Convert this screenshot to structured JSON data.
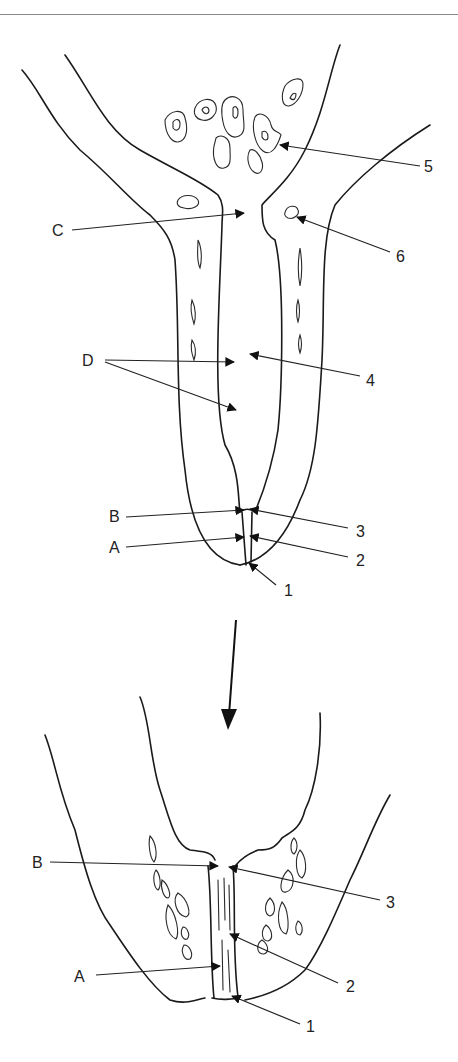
{
  "figure": {
    "type": "anatomical line diagram",
    "panels": [
      {
        "id": "upper",
        "labels_left": [
          "C",
          "D",
          "B",
          "A"
        ],
        "labels_right": [
          "5",
          "6",
          "4",
          "3",
          "2",
          "1"
        ]
      },
      {
        "id": "lower",
        "labels_left": [
          "B",
          "A"
        ],
        "labels_right": [
          "3",
          "2",
          "1"
        ]
      }
    ],
    "transition_arrow": "down-arrow"
  },
  "labels": {
    "upper": {
      "C": "C",
      "D": "D",
      "B": "B",
      "A": "A",
      "n5": "5",
      "n6": "6",
      "n4": "4",
      "n3": "3",
      "n2": "2",
      "n1": "1"
    },
    "lower": {
      "B": "B",
      "A": "A",
      "n3": "3",
      "n2": "2",
      "n1": "1"
    }
  },
  "colors": {
    "line": "#1a1a1a",
    "background": "#ffffff",
    "rule": "#8a8a8a"
  }
}
